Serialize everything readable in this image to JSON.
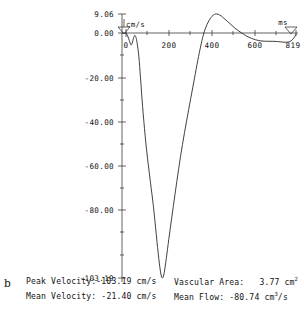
{
  "figure": {
    "panel_label": "b",
    "type": "doppler-velocity-waveform"
  },
  "chart_data": {
    "type": "line",
    "title": "",
    "xlabel": "ms",
    "ylabel": "cm/s",
    "xlim": [
      0,
      819
    ],
    "ylim": [
      -103.19,
      9.06
    ],
    "grid": false,
    "legend": "none",
    "x_ticks": [
      0,
      200,
      400,
      600,
      819
    ],
    "x_tick_labels": [
      "0",
      "200",
      "400",
      "600",
      "819"
    ],
    "y_ticks": [
      9.06,
      0.0,
      -20.0,
      -40.0,
      -60.0,
      -80.0,
      -103.19
    ],
    "y_tick_labels": [
      "9.06",
      "0.00",
      "-20.00",
      "-40.00",
      "-60.00",
      "-80.00",
      "-103.19"
    ],
    "x_unit_marker_label": "ms",
    "y_unit_marker_label": "cm/s",
    "series": [
      {
        "name": "velocity",
        "x": [
          0,
          8,
          16,
          24,
          30,
          36,
          42,
          48,
          54,
          62,
          70,
          80,
          92,
          104,
          118,
          132,
          146,
          158,
          168,
          176,
          184,
          194,
          206,
          220,
          236,
          254,
          272,
          292,
          312,
          330,
          346,
          360,
          372,
          384,
          396,
          408,
          420,
          432,
          444,
          458,
          472,
          488,
          506,
          524,
          544,
          566,
          588,
          606,
          622,
          640,
          660,
          684,
          708,
          730,
          752,
          772,
          790,
          806,
          819
        ],
        "y": [
          0.0,
          -1.2,
          -3.2,
          -5.0,
          -4.2,
          -2.2,
          -1.0,
          -1.8,
          -4.5,
          -10.0,
          -19.0,
          -31.0,
          -43.0,
          -53.0,
          -63.0,
          -73.0,
          -85.0,
          -95.0,
          -101.5,
          -103.19,
          -101.0,
          -95.0,
          -87.0,
          -78.0,
          -68.0,
          -57.0,
          -47.0,
          -37.0,
          -27.5,
          -19.0,
          -11.5,
          -5.5,
          -1.0,
          2.6,
          5.2,
          7.2,
          8.5,
          9.06,
          8.9,
          8.2,
          7.0,
          5.6,
          4.0,
          2.4,
          0.9,
          -0.5,
          -1.6,
          -2.3,
          -2.8,
          -3.2,
          -3.4,
          -3.5,
          -3.5,
          -3.6,
          -3.8,
          -3.9,
          -3.6,
          -2.4,
          -0.6
        ]
      }
    ]
  },
  "stats": {
    "peak_velocity_label": "Peak Velocity:",
    "peak_velocity_value": "-103.19 cm/s",
    "mean_velocity_label": "Mean Velocity:",
    "mean_velocity_value": "-21.40 cm/s",
    "vascular_area_label": "Vascular Area:",
    "vascular_area_value": "3.77 cm",
    "vascular_area_unit_sup": "2",
    "mean_flow_label": "Mean Flow:",
    "mean_flow_value": "-80.74 cm",
    "mean_flow_unit_sup": "3",
    "mean_flow_unit_tail": "/s"
  },
  "colors": {
    "trace": "#2b2b2b",
    "axis": "#3a3a3a",
    "text": "#141414",
    "background": "#ffffff"
  }
}
